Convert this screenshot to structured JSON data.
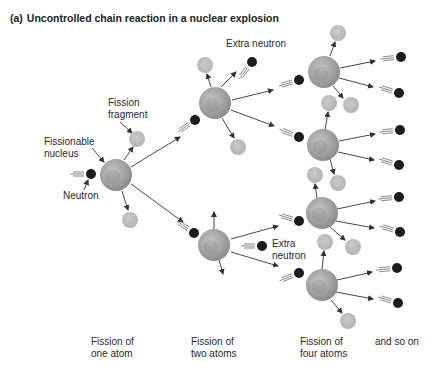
{
  "title": {
    "tag": "(a)",
    "text": "Uncontrolled chain reaction in a nuclear explosion"
  },
  "labels": {
    "fission_fragment": "Fission\nfragment",
    "fissionable_nucleus": "Fissionable\nnucleus",
    "neutron": "Neutron",
    "extra_neutron_top": "Extra neutron",
    "extra_neutron_mid": "Extra\nneutron"
  },
  "stages": [
    {
      "label": "Fission of\none atom"
    },
    {
      "label": "Fission of\ntwo atoms"
    },
    {
      "label": "Fission of\nfour atoms"
    },
    {
      "label": "and so on"
    }
  ],
  "colors": {
    "nucleus": "#a8a8a8",
    "nucleus_dark": "#7c7c7c",
    "fragment": "#bdbdbd",
    "neutron": "#1c1c1c",
    "arrow": "#333333",
    "text": "#2a2a2a"
  },
  "diagram": {
    "nuclei": [
      {
        "id": "n1",
        "x": 116,
        "y": 175,
        "r": 16
      },
      {
        "id": "n2a",
        "x": 215,
        "y": 103,
        "r": 16
      },
      {
        "id": "n2b",
        "x": 214,
        "y": 245,
        "r": 16
      },
      {
        "id": "n3a",
        "x": 324,
        "y": 72,
        "r": 16
      },
      {
        "id": "n3b",
        "x": 323,
        "y": 145,
        "r": 16
      },
      {
        "id": "n3c",
        "x": 322,
        "y": 213,
        "r": 16
      },
      {
        "id": "n3d",
        "x": 322,
        "y": 285,
        "r": 16
      }
    ],
    "fragments": [
      {
        "x": 137,
        "y": 139,
        "r": 8
      },
      {
        "x": 130,
        "y": 220,
        "r": 8
      },
      {
        "x": 205,
        "y": 65,
        "r": 8
      },
      {
        "x": 238,
        "y": 147,
        "r": 8
      },
      {
        "x": 338,
        "y": 33,
        "r": 8
      },
      {
        "x": 329,
        "y": 103,
        "r": 8
      },
      {
        "x": 351,
        "y": 105,
        "r": 8
      },
      {
        "x": 315,
        "y": 175,
        "r": 8
      },
      {
        "x": 338,
        "y": 183,
        "r": 8
      },
      {
        "x": 325,
        "y": 242,
        "r": 8
      },
      {
        "x": 353,
        "y": 247,
        "r": 8
      },
      {
        "x": 348,
        "y": 321,
        "r": 8
      }
    ],
    "neutrons": [
      {
        "x": 91,
        "y": 174,
        "dx": -1,
        "dy": 0
      },
      {
        "x": 252,
        "y": 62,
        "dx": -0.6,
        "dy": 0.8
      },
      {
        "x": 195,
        "y": 120,
        "dx": -1,
        "dy": 0.7
      },
      {
        "x": 194,
        "y": 233,
        "dx": -1,
        "dy": -0.7
      },
      {
        "x": 262,
        "y": 246,
        "dx": -1,
        "dy": 0
      },
      {
        "x": 299,
        "y": 80,
        "dx": -1,
        "dy": 0.3
      },
      {
        "x": 299,
        "y": 137,
        "dx": -1,
        "dy": -0.4
      },
      {
        "x": 299,
        "y": 221,
        "dx": -1,
        "dy": -0.3
      },
      {
        "x": 299,
        "y": 273,
        "dx": -1,
        "dy": 0.4
      },
      {
        "x": 401,
        "y": 57,
        "dx": -1,
        "dy": 0.1
      },
      {
        "x": 399,
        "y": 93,
        "dx": -1,
        "dy": -0.3
      },
      {
        "x": 400,
        "y": 130,
        "dx": -1,
        "dy": 0.1
      },
      {
        "x": 399,
        "y": 165,
        "dx": -1,
        "dy": -0.3
      },
      {
        "x": 399,
        "y": 197,
        "dx": -1,
        "dy": 0.1
      },
      {
        "x": 400,
        "y": 232,
        "dx": -1,
        "dy": -0.3
      },
      {
        "x": 397,
        "y": 268,
        "dx": -1,
        "dy": 0.1
      },
      {
        "x": 398,
        "y": 303,
        "dx": -1,
        "dy": -0.3
      }
    ],
    "arrows": [
      {
        "x1": 124,
        "y1": 160,
        "x2": 133,
        "y2": 147
      },
      {
        "x1": 122,
        "y1": 191,
        "x2": 128,
        "y2": 210
      },
      {
        "x1": 131,
        "y1": 167,
        "x2": 180,
        "y2": 137
      },
      {
        "x1": 131,
        "y1": 184,
        "x2": 183,
        "y2": 222
      },
      {
        "x1": 211,
        "y1": 87,
        "x2": 207,
        "y2": 74
      },
      {
        "x1": 221,
        "y1": 87,
        "x2": 236,
        "y2": 72
      },
      {
        "x1": 222,
        "y1": 118,
        "x2": 234,
        "y2": 138
      },
      {
        "x1": 232,
        "y1": 100,
        "x2": 273,
        "y2": 90
      },
      {
        "x1": 231,
        "y1": 110,
        "x2": 274,
        "y2": 126
      },
      {
        "x1": 214,
        "y1": 229,
        "x2": 214,
        "y2": 212
      },
      {
        "x1": 219,
        "y1": 260,
        "x2": 223,
        "y2": 274
      },
      {
        "x1": 231,
        "y1": 239,
        "x2": 278,
        "y2": 226
      },
      {
        "x1": 231,
        "y1": 252,
        "x2": 278,
        "y2": 266
      },
      {
        "x1": 330,
        "y1": 56,
        "x2": 335,
        "y2": 42
      },
      {
        "x1": 333,
        "y1": 86,
        "x2": 343,
        "y2": 98
      },
      {
        "x1": 340,
        "y1": 68,
        "x2": 375,
        "y2": 61
      },
      {
        "x1": 339,
        "y1": 78,
        "x2": 373,
        "y2": 87
      },
      {
        "x1": 325,
        "y1": 130,
        "x2": 328,
        "y2": 112
      },
      {
        "x1": 339,
        "y1": 141,
        "x2": 375,
        "y2": 134
      },
      {
        "x1": 338,
        "y1": 152,
        "x2": 374,
        "y2": 160
      },
      {
        "x1": 330,
        "y1": 159,
        "x2": 334,
        "y2": 174
      },
      {
        "x1": 317,
        "y1": 198,
        "x2": 315,
        "y2": 184
      },
      {
        "x1": 337,
        "y1": 209,
        "x2": 375,
        "y2": 201
      },
      {
        "x1": 336,
        "y1": 221,
        "x2": 374,
        "y2": 228
      },
      {
        "x1": 330,
        "y1": 227,
        "x2": 345,
        "y2": 240
      },
      {
        "x1": 322,
        "y1": 269,
        "x2": 324,
        "y2": 251
      },
      {
        "x1": 337,
        "y1": 280,
        "x2": 372,
        "y2": 272
      },
      {
        "x1": 336,
        "y1": 292,
        "x2": 373,
        "y2": 299
      },
      {
        "x1": 331,
        "y1": 300,
        "x2": 342,
        "y2": 313
      }
    ],
    "pointers": [
      {
        "x1": 120,
        "y1": 122,
        "x2": 132,
        "y2": 133
      },
      {
        "x1": 92,
        "y1": 148,
        "x2": 104,
        "y2": 162
      },
      {
        "x1": 84,
        "y1": 190,
        "x2": 88,
        "y2": 180
      }
    ]
  }
}
